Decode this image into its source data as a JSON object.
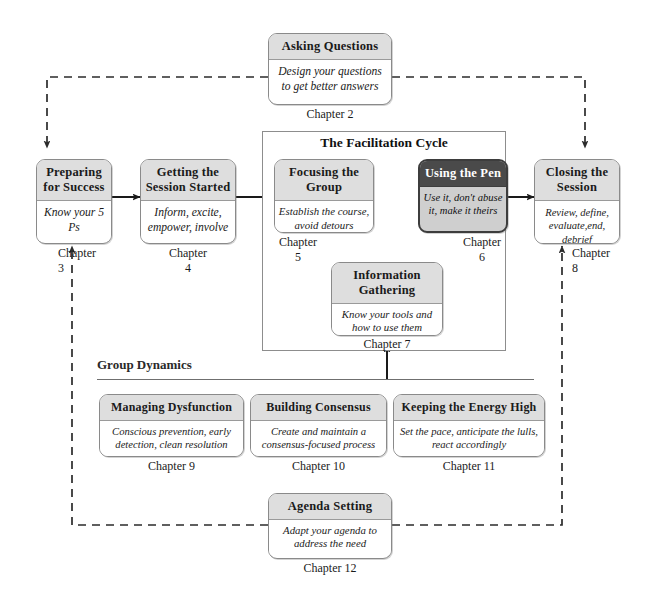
{
  "diagram": {
    "title": "The Facilitation Cycle",
    "cycle_panel_label": "The Facilitation Cycle",
    "group_dynamics_label": "Group Dynamics",
    "colors": {
      "header_fill": "#dedede",
      "body_fill": "#ffffff",
      "border": "#8a8a8a",
      "highlight_header_fill": "#4a4a4a",
      "highlight_body_fill": "#cfcfcf",
      "highlight_border": "#3d3d3d",
      "connector": "#1a1a1a"
    }
  },
  "nodes": {
    "asking_questions": {
      "title": "Asking Questions",
      "subtitle": "Design your questions\nto get better answers",
      "chapter": "Chapter 2"
    },
    "preparing_for_success": {
      "title": "Preparing\nfor Success",
      "subtitle": "Know your\n5 Ps",
      "chapter": "Chapter\n3"
    },
    "getting_the_session_started": {
      "title": "Getting the\nSession Started",
      "subtitle": "Inform, excite,\nempower, involve",
      "chapter": "Chapter\n4"
    },
    "focusing_the_group": {
      "title": "Focusing\nthe Group",
      "subtitle": "Establish the course,\navoid detours",
      "chapter": "Chapter\n5"
    },
    "using_the_pen": {
      "title": "Using\nthe Pen",
      "subtitle": "Use it, don't abuse\nit, make it theirs",
      "chapter": "Chapter\n6",
      "highlighted": true
    },
    "information_gathering": {
      "title": "Information\nGathering",
      "subtitle": "Know your tools\nand how to use them",
      "chapter": "Chapter 7"
    },
    "closing_the_session": {
      "title": "Closing the\nSession",
      "subtitle": "Review, define,\nevaluate,end, debrief",
      "chapter": "Chapter\n8"
    },
    "managing_dysfunction": {
      "title": "Managing Dysfunction",
      "subtitle": "Conscious prevention, early\ndetection, clean resolution",
      "chapter": "Chapter 9"
    },
    "building_consensus": {
      "title": "Building Consensus",
      "subtitle": "Create and maintain a\nconsensus-focused process",
      "chapter": "Chapter 10"
    },
    "keeping_the_energy_high": {
      "title": "Keeping the Energy High",
      "subtitle": "Set the pace, anticipate the\nlulls, react accordingly",
      "chapter": "Chapter 11"
    },
    "agenda_setting": {
      "title": "Agenda Setting",
      "subtitle": "Adapt your agenda to\naddress the need",
      "chapter": "Chapter 12"
    }
  }
}
